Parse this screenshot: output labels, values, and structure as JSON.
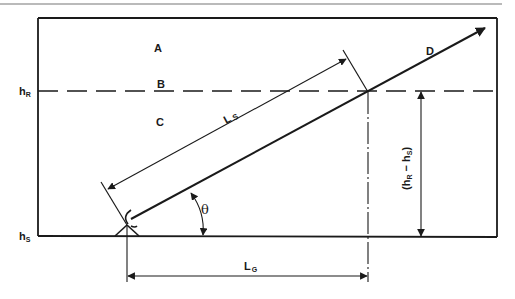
{
  "diagram": {
    "regions": {
      "A": "A",
      "B": "B",
      "C": "C",
      "D": "D"
    },
    "labels": {
      "hR_main": "h",
      "hR_sub": "R",
      "hS_main": "h",
      "hS_sub": "S",
      "LS_main": "L",
      "LS_sub": "S",
      "LG_main": "L",
      "LG_sub": "G",
      "theta": "θ",
      "height_diff": "(h",
      "height_diff_R": "R",
      "height_diff_mid": " − h",
      "height_diff_S": "S",
      "height_diff_close": ")"
    },
    "colors": {
      "stroke": "#1a1a1a",
      "background": "#ffffff",
      "top_rule": "#777777"
    }
  }
}
